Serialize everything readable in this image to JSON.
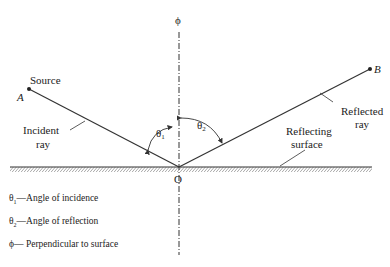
{
  "diagram": {
    "labels": {
      "normal_symbol": "ϕ",
      "source": "Source",
      "point_a": "A",
      "point_b": "B",
      "origin": "O",
      "incident_ray": [
        "Incident",
        "ray"
      ],
      "reflected_ray": [
        "Reflected",
        "ray"
      ],
      "reflecting_surface": [
        "Reflecting",
        "surface"
      ],
      "theta1": "θ",
      "theta1_sub": "1",
      "theta2": "θ",
      "theta2_sub": "2"
    },
    "legend": [
      {
        "symbol": "θ",
        "sub": "1",
        "text": "—Angle of incidence"
      },
      {
        "symbol": "θ",
        "sub": "2",
        "text": "—Angle of reflection"
      },
      {
        "symbol": "ϕ",
        "sub": "",
        "text": "— Perpendicular to surface"
      }
    ],
    "colors": {
      "line": "#333333",
      "background": "#ffffff"
    }
  }
}
